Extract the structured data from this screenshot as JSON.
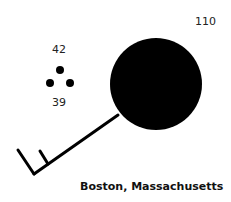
{
  "station_model": {
    "location": "Boston, Massachusetts",
    "pressure": "110",
    "temperature": "42",
    "dew_point": "39",
    "weather_symbol": "rain-three-dots",
    "sky_cover": "overcast-filled-circle",
    "wind": "wind-barb-one-and-half-barbs",
    "colors": {
      "ink": "#000000",
      "background": "#ffffff"
    }
  }
}
